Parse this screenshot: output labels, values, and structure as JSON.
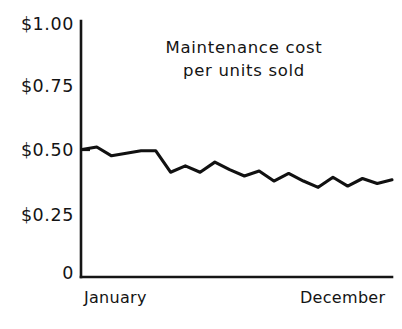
{
  "chart_data": {
    "type": "line",
    "title": "Maintenance cost per units sold",
    "title_lines": [
      "Maintenance cost",
      "per units sold"
    ],
    "xlabel": "",
    "ylabel": "",
    "ylim": [
      0,
      1.0
    ],
    "ytick_labels": [
      "$1.00",
      "$0.75",
      "$0.50",
      "$0.25",
      "0"
    ],
    "ytick_values": [
      1.0,
      0.75,
      0.5,
      0.25,
      0
    ],
    "xtick_labels": [
      "January",
      "December"
    ],
    "xlim_labels": [
      "January",
      "December"
    ],
    "grid": false,
    "legend": false,
    "legend_position": "none",
    "line_color": "#111111",
    "axis_color": "#151515",
    "background_color": "#ffffff",
    "x": [
      0,
      1,
      2,
      3,
      4,
      5,
      6,
      7,
      8,
      9,
      10,
      11,
      12,
      13,
      14,
      15,
      16,
      17,
      18,
      19,
      20,
      21
    ],
    "values": [
      0.49,
      0.5,
      0.465,
      0.475,
      0.485,
      0.485,
      0.4,
      0.425,
      0.4,
      0.44,
      0.41,
      0.385,
      0.405,
      0.365,
      0.395,
      0.365,
      0.34,
      0.38,
      0.345,
      0.375,
      0.355,
      0.37
    ],
    "series": [
      {
        "name": "Maintenance cost per units sold",
        "values": [
          0.49,
          0.5,
          0.465,
          0.475,
          0.485,
          0.485,
          0.4,
          0.425,
          0.4,
          0.44,
          0.41,
          0.385,
          0.405,
          0.365,
          0.395,
          0.365,
          0.34,
          0.38,
          0.345,
          0.375,
          0.355,
          0.37
        ]
      }
    ],
    "annotations": []
  },
  "chart": {
    "title_line_1": "Maintenance cost",
    "title_line_2": "per units sold",
    "ylabels": {
      "t100": "$1.00",
      "t075": "$0.75",
      "t050": "$0.50",
      "t025": "$0.25",
      "t000": "0"
    },
    "xlabels": {
      "start": "January",
      "end": "December"
    }
  }
}
